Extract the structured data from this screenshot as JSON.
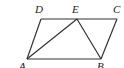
{
  "figure": {
    "type": "parallelogram with interior triangle",
    "points": {
      "A": {
        "label": "A",
        "x": 27,
        "y": 59,
        "lx": 20,
        "ly": 70
      },
      "B": {
        "label": "B",
        "x": 101,
        "y": 59,
        "lx": 97,
        "ly": 70
      },
      "C": {
        "label": "C",
        "x": 117,
        "y": 19,
        "lx": 113,
        "ly": 13
      },
      "D": {
        "label": "D",
        "x": 41,
        "y": 19,
        "lx": 35,
        "ly": 13
      },
      "E": {
        "label": "E",
        "x": 77,
        "y": 19,
        "lx": 72,
        "ly": 13
      }
    },
    "segments": [
      "AB",
      "BC",
      "CD",
      "DA",
      "AE",
      "BE"
    ]
  }
}
